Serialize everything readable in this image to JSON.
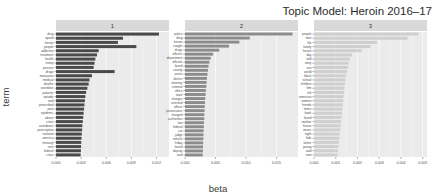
{
  "chart_data": {
    "type": "bar",
    "title": "Topic Model: Heroin 2016–17",
    "xlabel": "beta",
    "ylabel": "term",
    "orientation": "horizontal",
    "faceted": true,
    "grid": true,
    "legend": "none",
    "panel_background": "#ebebeb",
    "strip_background": "#d9d9d9",
    "gridline_color": "#ffffff",
    "panels": [
      {
        "label": "1",
        "bar_color": "#4a4a4a",
        "xlim": [
          0,
          0.0135
        ],
        "xticks": [
          0,
          0.003,
          0.006,
          0.009,
          0.012
        ],
        "xticklabels": [
          "0.000",
          "0.003",
          "0.006",
          "0.009",
          "0.012"
        ],
        "categories": [
          "drug",
          "opioid",
          "heroin",
          "people",
          "addiction",
          "treatment",
          "health",
          "trump",
          "percent",
          "drugs",
          "marijuana",
          "medical",
          "deaths",
          "overdose",
          "patients",
          "opioids",
          "said",
          "prescribed",
          "pain",
          "epidemic",
          "abuse",
          "crisis",
          "overdoses",
          "prescription",
          "national",
          "america",
          "fentanyl",
          "rate",
          "federal",
          "crisis2"
        ],
        "values": [
          0.0123,
          0.008,
          0.0074,
          0.0096,
          0.0051,
          0.0049,
          0.0047,
          0.0046,
          0.0045,
          0.007,
          0.0043,
          0.004,
          0.0039,
          0.00375,
          0.0036,
          0.0035,
          0.00345,
          0.0034,
          0.00335,
          0.0033,
          0.00325,
          0.0032,
          0.00315,
          0.00312,
          0.00308,
          0.00305,
          0.00302,
          0.003,
          0.00298,
          0.00295
        ]
      },
      {
        "label": "2",
        "bar_color": "#8c8c8c",
        "xlim": [
          0,
          0.0185
        ],
        "xticks": [
          0,
          0.005,
          0.01,
          0.015
        ],
        "xticklabels": [
          "0.000",
          "0.005",
          "0.010",
          "0.015"
        ],
        "categories": [
          "police",
          "drug",
          "heroin",
          "caught",
          "drugs",
          "officers",
          "department",
          "officials",
          "found",
          "county",
          "arrest",
          "district",
          "attorney",
          "criminal",
          "office",
          "state",
          "charges",
          "arrested",
          "officer",
          "prosecutors",
          "charged",
          "authorities",
          "law",
          "federal",
          "car",
          "judge",
          "vehicle",
          "friday",
          "found2",
          "deputy",
          "said"
        ],
        "values": [
          0.0176,
          0.0106,
          0.0089,
          0.0072,
          0.0056,
          0.0046,
          0.0042,
          0.004,
          0.00385,
          0.00375,
          0.00368,
          0.0036,
          0.00354,
          0.00348,
          0.00342,
          0.00338,
          0.00332,
          0.00328,
          0.00324,
          0.0032,
          0.00317,
          0.00314,
          0.00311,
          0.00308,
          0.00305,
          0.00302,
          0.003,
          0.00297,
          0.00295,
          0.00293,
          0.0029
        ]
      },
      {
        "label": "3",
        "bar_color": "#cfcfcf",
        "xlim": [
          0,
          0.0052
        ],
        "xticks": [
          0,
          0.001,
          0.002,
          0.003,
          0.004,
          0.005
        ],
        "xticklabels": [
          "0.000",
          "0.001",
          "0.002",
          "0.003",
          "0.004",
          "0.005"
        ],
        "categories": [
          "people",
          "time",
          "life",
          "family",
          "heroin",
          "day",
          "told",
          "story",
          "son",
          "world",
          "black",
          "school",
          "children",
          "film",
          "left",
          "american",
          "women",
          "friends",
          "home",
          "book",
          "found",
          "mother",
          "house",
          "music",
          "night",
          "kids",
          "father",
          "young",
          "said",
          "new"
        ],
        "values": [
          0.0048,
          0.0043,
          0.0029,
          0.0026,
          0.0022,
          0.00175,
          0.00165,
          0.0016,
          0.00156,
          0.00152,
          0.00148,
          0.00145,
          0.00142,
          0.0014,
          0.00138,
          0.00136,
          0.00134,
          0.00132,
          0.0013,
          0.00128,
          0.00126,
          0.00124,
          0.00122,
          0.0012,
          0.00118,
          0.00116,
          0.00114,
          0.00112,
          0.0011,
          0.00108
        ]
      }
    ]
  }
}
